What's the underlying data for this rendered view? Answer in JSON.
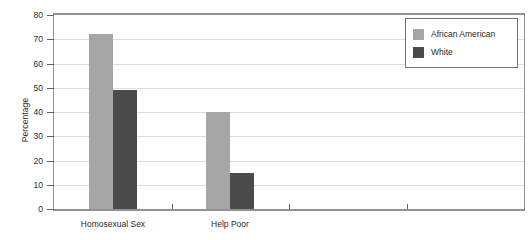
{
  "chart_data": {
    "type": "bar",
    "title": "",
    "xlabel": "",
    "ylabel": "Percentage",
    "ylim": [
      0,
      80
    ],
    "yticks": [
      0,
      10,
      20,
      30,
      40,
      50,
      60,
      70,
      80
    ],
    "ytick_labels": [
      "0",
      "10",
      "20",
      "30",
      "40",
      "50",
      "60",
      "70",
      "80"
    ],
    "grid": true,
    "legend_position": "top-right",
    "categories": [
      "Homosexual Sex",
      "Help Poor"
    ],
    "series": [
      {
        "name": "African American",
        "color": "#a6a6a6",
        "values": [
          72,
          40
        ]
      },
      {
        "name": "White",
        "color": "#4b4b4b",
        "values": [
          49,
          15
        ]
      }
    ],
    "extra_xtick_count": 2
  },
  "legend": {
    "entries": [
      {
        "label": "African American"
      },
      {
        "label": "White"
      }
    ]
  },
  "axes": {
    "y_title": "Percentage"
  },
  "colors": {
    "series_light": "#a6a6a6",
    "series_dark": "#4b4b4b",
    "frame": "#8f9296",
    "gridline": "#dcdde0",
    "text": "#2b2b2b",
    "background": "#ffffff"
  }
}
